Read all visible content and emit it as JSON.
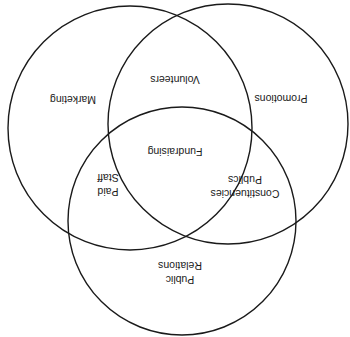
{
  "diagram": {
    "type": "venn",
    "orientation": "rotated-180",
    "line_color": "#1a1a1a",
    "background": "#ffffff",
    "circles": [
      {
        "id": "left",
        "label": "Marketing",
        "cx": 130,
        "cy": 128,
        "r": 122
      },
      {
        "id": "right",
        "label": "Promotions",
        "cx": 228,
        "cy": 124,
        "r": 120
      },
      {
        "id": "bottom",
        "label": "Public Relations",
        "cx": 182,
        "cy": 221,
        "r": 114
      }
    ],
    "regions": {
      "marketing": {
        "lines": [
          "Marketing"
        ],
        "x": 73,
        "y": 100
      },
      "promotions": {
        "lines": [
          "Promotions"
        ],
        "x": 281,
        "y": 99
      },
      "volunteers": {
        "lines": [
          "Volunteers"
        ],
        "x": 175,
        "y": 80
      },
      "fundraising": {
        "lines": [
          "Fundraising"
        ],
        "x": 175,
        "y": 152
      },
      "paid_staff": {
        "lines": [
          "Paid",
          "Staff"
        ],
        "x": 108,
        "y": 185
      },
      "constituencies_publics": {
        "lines": [
          "Constituencies",
          "Publics"
        ],
        "x": 245,
        "y": 187
      },
      "public_relations": {
        "lines": [
          "Public",
          "Relations"
        ],
        "x": 180,
        "y": 273
      }
    }
  }
}
